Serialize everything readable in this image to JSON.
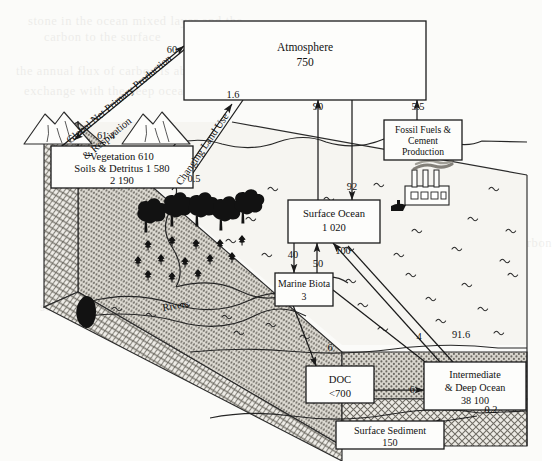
{
  "figure": {
    "kind": "global-carbon-cycle-diagram"
  },
  "boxes": {
    "atmosphere": {
      "name": "Atmosphere",
      "value": "750"
    },
    "vegetation": {
      "line1": "Vegetation 610",
      "line2": "Soils & Detritus 1 580",
      "line3": "2 190"
    },
    "fossil": {
      "line1": "Fossil Fuels &",
      "line2": "Cement",
      "line3": "Production"
    },
    "surface_ocean": {
      "name": "Surface Ocean",
      "value": "1 020"
    },
    "marine_biota": {
      "name": "Marine Biota",
      "value": "3"
    },
    "doc": {
      "name": "DOC",
      "value": "<700"
    },
    "deep_ocean": {
      "line1": "Intermediate",
      "line2": "& Deep Ocean",
      "line3": "38 100"
    },
    "sediment": {
      "name": "Surface Sediment",
      "value": "150"
    }
  },
  "flux_labels": {
    "npp_up": "60",
    "npp_down": "61.4",
    "npp_text_1": "Global Net Primary Production",
    "npp_text_2": "& Respiration",
    "land_use_up": "1.6",
    "land_use_down": "0.5",
    "land_use_text": "Changing Land Use",
    "ocean_to_atm": "90",
    "atm_to_ocean": "92",
    "fossil_to_atm": "5.5",
    "ocean_to_biota": "40",
    "biota_to_ocean": "50",
    "deep_to_surface": "100",
    "biota_to_doc": "6",
    "biota_to_deep": "4",
    "surface_to_deep": "91.6",
    "doc_to_deep": "6",
    "deep_to_sediment": "0.2",
    "rivers": "Rivers"
  },
  "icons": {
    "mountain": "mountain-icon",
    "tree": "tree-icon",
    "shrub": "shrub-icon",
    "factory": "factory-icon",
    "smoke": "smoke-icon",
    "wave": "wave-icon",
    "ship": "ship-icon"
  },
  "colors": {
    "ink": "#1b1b1b",
    "paper": "#fbfbf9",
    "land_top": "#f4f3ef",
    "crust_dark": "#9a978f",
    "crust_light": "#cfccc4",
    "water": "#ffffff"
  },
  "background_noise": [
    "stone in the ocean mixed layer and the",
    "carbon to the surface",
    "the annual flux of carbon is about",
    "exchange with the deep ocean where",
    "a further small flux returns carbon",
    "sedimentation removes carbon slowly"
  ]
}
